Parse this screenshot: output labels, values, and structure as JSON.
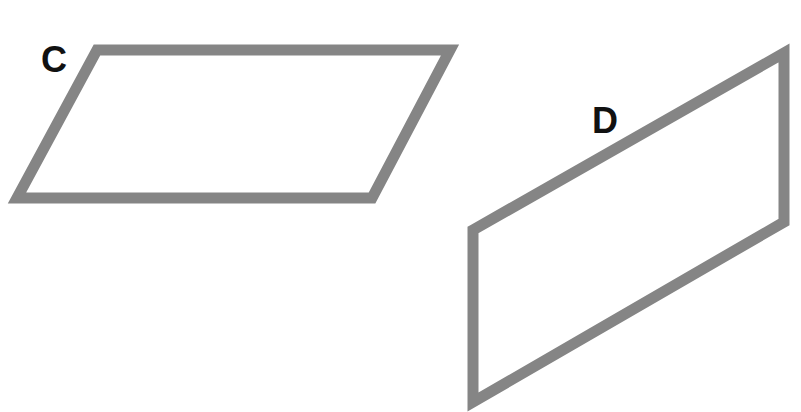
{
  "diagram": {
    "stroke_color": "#858585",
    "stroke_width": 11,
    "label_color": "#111111",
    "shapes": [
      {
        "id": "C",
        "label": "C",
        "kind": "parallelogram",
        "points": "97,50 450,50 372,198 17,198",
        "label_x": 41,
        "label_y": 72
      },
      {
        "id": "D",
        "label": "D",
        "kind": "parallelogram",
        "points": "473,230 784,53 784,222 473,402",
        "label_x": 592,
        "label_y": 133
      }
    ]
  }
}
